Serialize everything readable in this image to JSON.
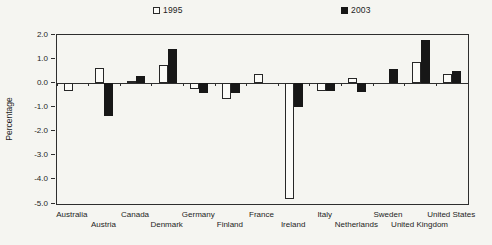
{
  "chart_data": {
    "type": "bar",
    "title": "",
    "xlabel": "",
    "ylabel": "Percentage",
    "ylim": [
      -5.0,
      2.0
    ],
    "yticks": [
      2.0,
      1.0,
      0.0,
      -1.0,
      -2.0,
      -3.0,
      -4.0,
      -5.0
    ],
    "grid": false,
    "legend_position": "top",
    "categories": [
      "Australia",
      "Austria",
      "Canada",
      "Denmark",
      "Germany",
      "Finland",
      "France",
      "Ireland",
      "Italy",
      "Netherlands",
      "Sweden",
      "United Kingdom",
      "United States"
    ],
    "series": [
      {
        "name": "1995",
        "swatch": "white",
        "color": "#fbfbf8",
        "values": [
          -0.3,
          0.65,
          0.1,
          0.75,
          -0.25,
          -0.65,
          0.4,
          -4.8,
          -0.3,
          0.2,
          0.0,
          0.9,
          0.4
        ]
      },
      {
        "name": "2003",
        "swatch": "black",
        "color": "#171717",
        "values": [
          0.0,
          -1.35,
          0.3,
          1.4,
          -0.4,
          -0.4,
          0.0,
          -1.0,
          -0.3,
          -0.35,
          0.6,
          1.8,
          0.5
        ]
      }
    ]
  },
  "colors": {
    "background": "#f5f5f1",
    "axis": "#2e2e2e",
    "bar_1995": "#fbfbf8",
    "bar_2003": "#171717"
  }
}
